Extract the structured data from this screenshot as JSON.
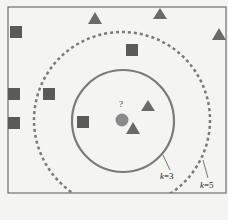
{
  "diagram": {
    "query_label": "?",
    "circles": [
      {
        "label_k": "k",
        "label_val": "=3",
        "style": "solid"
      },
      {
        "label_k": "k",
        "label_val": "=5",
        "style": "dashed"
      }
    ],
    "colors": {
      "background": "#f4f4f2",
      "frame": "#6e6e6e",
      "square": "#5a5a5a",
      "triangle": "#6a6a6a",
      "query": "#8a8a8a",
      "circle": "#7a7a7a"
    },
    "classes": [
      "square",
      "triangle"
    ]
  }
}
